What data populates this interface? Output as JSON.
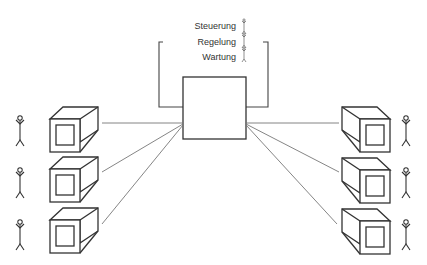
{
  "diagram": {
    "roles": [
      {
        "label": "Steuerung"
      },
      {
        "label": "Regelung"
      },
      {
        "label": "Wartung"
      }
    ],
    "central_unit": {
      "name": "central-computer"
    },
    "terminals_left": [
      {
        "id": "L1"
      },
      {
        "id": "L2"
      },
      {
        "id": "L3"
      }
    ],
    "terminals_right": [
      {
        "id": "R1"
      },
      {
        "id": "R2"
      },
      {
        "id": "R3"
      }
    ],
    "colors": {
      "stroke": "#333333",
      "line": "#777777",
      "background": "#ffffff"
    }
  }
}
